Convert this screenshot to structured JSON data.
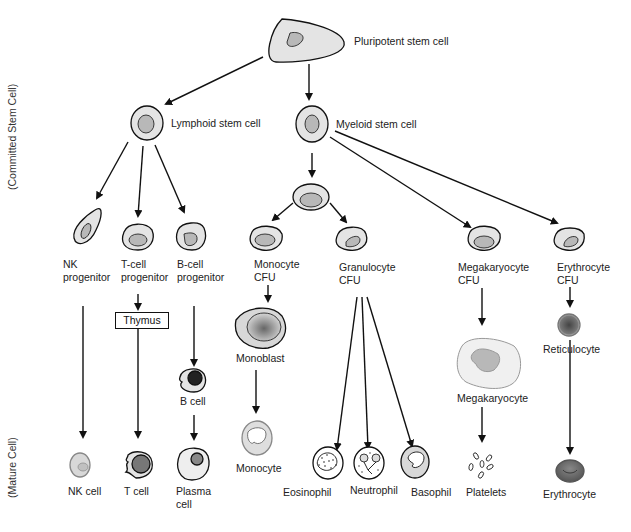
{
  "diagram": {
    "side_labels": {
      "committed": "(Committed Stem Cell)",
      "mature": "(Mature Cell)"
    },
    "nodes": {
      "pluripotent": "Pluripotent stem cell",
      "lymphoid": "Lymphoid stem cell",
      "myeloid": "Myeloid stem cell",
      "nk_progenitor": [
        "NK",
        "progenitor"
      ],
      "t_progenitor": [
        "T-cell",
        "progenitor"
      ],
      "b_progenitor": [
        "B-cell",
        "progenitor"
      ],
      "monocyte_cfu": [
        "Monocyte",
        "CFU"
      ],
      "granulocyte_cfu": [
        "Granulocyte",
        "CFU"
      ],
      "megakaryocyte_cfu": [
        "Megakaryocyte",
        "CFU"
      ],
      "erythrocyte_cfu": [
        "Erythrocyte",
        "CFU"
      ],
      "thymus": "Thymus",
      "monoblast": "Monoblast",
      "b_cell": "B cell",
      "megakaryocyte": "Megakaryocyte",
      "reticulocyte": "Reticulocyte",
      "nk_cell": "NK cell",
      "t_cell": "T cell",
      "plasma_cell": [
        "Plasma",
        "cell"
      ],
      "monocyte": "Monocyte",
      "eosinophil": "Eosinophil",
      "neutrophil": "Neutrophil",
      "basophil": "Basophil",
      "platelets": "Platelets",
      "erythrocyte": "Erythrocyte"
    },
    "colors": {
      "cell_fill": "#e4e4e4",
      "nucleus_fill": "#b8b8b8",
      "stroke": "#111111"
    }
  }
}
